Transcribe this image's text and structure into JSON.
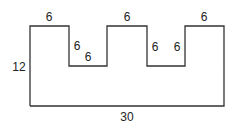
{
  "diagram": {
    "type": "rectilinear-shape",
    "stroke_color": "#333333",
    "background": "#ffffff",
    "labels": {
      "top_left_segment": "6",
      "notch1_left_side": "6",
      "notch1_bottom": "6",
      "top_middle_segment": "6",
      "notch2_left_side": "6",
      "notch2_right_side": "6",
      "top_right_segment": "6",
      "left_height": "12",
      "bottom_width": "30"
    }
  }
}
